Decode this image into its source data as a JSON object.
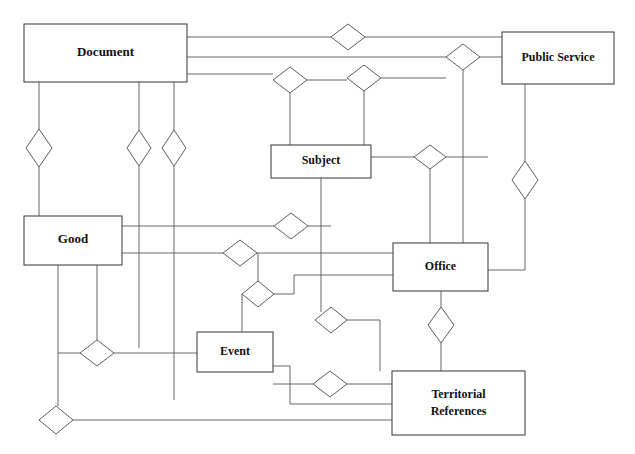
{
  "diagram": {
    "type": "er-diagram",
    "canvas": {
      "width": 635,
      "height": 454
    },
    "style": {
      "background_color": "#ffffff",
      "line_color": "#555555",
      "entity_border_color": "#3d3d3d",
      "entity_fill_color": "#ffffff",
      "relationship_border_color": "#4a4a4a",
      "relationship_fill_color": "#ffffff",
      "text_color": "#111111"
    },
    "entities": [
      {
        "id": "document",
        "label": "Document",
        "x": 24,
        "y": 24,
        "width": 163,
        "height": 58,
        "font_size": 13
      },
      {
        "id": "public_service",
        "label": "Public Service",
        "x": 502,
        "y": 32,
        "width": 112,
        "height": 52,
        "font_size": 12
      },
      {
        "id": "subject",
        "label": "Subject",
        "x": 271,
        "y": 145,
        "width": 100,
        "height": 33,
        "font_size": 12
      },
      {
        "id": "good",
        "label": "Good",
        "x": 24,
        "y": 216,
        "width": 98,
        "height": 49,
        "font_size": 13
      },
      {
        "id": "office",
        "label": "Office",
        "x": 393,
        "y": 243,
        "width": 95,
        "height": 48,
        "font_size": 12
      },
      {
        "id": "event",
        "label": "Event",
        "x": 197,
        "y": 332,
        "width": 76,
        "height": 40,
        "font_size": 12
      },
      {
        "id": "territorial_references",
        "label_line_1": "Territorial",
        "label_line_2": "References",
        "x": 392,
        "y": 371,
        "width": 133,
        "height": 64,
        "font_size": 12
      }
    ],
    "relationships": [
      {
        "id": "r1",
        "cx": 348,
        "cy": 37,
        "rx": 17,
        "ry": 13,
        "connects": [
          "document",
          "public_service"
        ]
      },
      {
        "id": "r2",
        "cx": 463,
        "cy": 57,
        "rx": 17,
        "ry": 13,
        "connects": [
          "document",
          "public_service"
        ]
      },
      {
        "id": "r3",
        "cx": 290,
        "cy": 80,
        "rx": 17,
        "ry": 13,
        "connects": [
          "document",
          "subject"
        ]
      },
      {
        "id": "r4",
        "cx": 364,
        "cy": 78,
        "rx": 17,
        "ry": 13,
        "connects": [
          "document",
          "subject"
        ]
      },
      {
        "id": "r5",
        "cx": 39,
        "cy": 148,
        "rx": 13,
        "ry": 19,
        "connects": [
          "document",
          "good"
        ]
      },
      {
        "id": "r6",
        "cx": 139,
        "cy": 148,
        "rx": 12,
        "ry": 18,
        "connects": [
          "document",
          "event"
        ]
      },
      {
        "id": "r7",
        "cx": 174,
        "cy": 148,
        "rx": 12,
        "ry": 18,
        "connects": [
          "document",
          "territorial_references"
        ]
      },
      {
        "id": "r8",
        "cx": 430,
        "cy": 157,
        "rx": 16,
        "ry": 12,
        "connects": [
          "subject",
          "office"
        ]
      },
      {
        "id": "r9",
        "cx": 525,
        "cy": 180,
        "rx": 13,
        "ry": 19,
        "connects": [
          "public_service",
          "office"
        ]
      },
      {
        "id": "r10",
        "cx": 291,
        "cy": 226,
        "rx": 17,
        "ry": 13,
        "connects": [
          "good",
          "subject"
        ]
      },
      {
        "id": "r11",
        "cx": 240,
        "cy": 253,
        "rx": 17,
        "ry": 13,
        "connects": [
          "good",
          "office"
        ]
      },
      {
        "id": "r12",
        "cx": 258,
        "cy": 294,
        "rx": 16,
        "ry": 13,
        "connects": [
          "event",
          "office"
        ]
      },
      {
        "id": "r13",
        "cx": 331,
        "cy": 320,
        "rx": 16,
        "ry": 13,
        "connects": [
          "subject",
          "territorial_references"
        ]
      },
      {
        "id": "r14",
        "cx": 441,
        "cy": 325,
        "rx": 13,
        "ry": 18,
        "connects": [
          "office",
          "territorial_references"
        ]
      },
      {
        "id": "r15",
        "cx": 97,
        "cy": 353,
        "rx": 17,
        "ry": 13,
        "connects": [
          "good",
          "event"
        ]
      },
      {
        "id": "r16",
        "cx": 330,
        "cy": 384,
        "rx": 17,
        "ry": 13,
        "connects": [
          "event",
          "territorial_references"
        ]
      },
      {
        "id": "r17",
        "cx": 56,
        "cy": 420,
        "rx": 17,
        "ry": 14,
        "connects": [
          "good",
          "territorial_references"
        ]
      }
    ],
    "connector_paths": [
      "M 187 37 L 331 37",
      "M 365 37 L 502 37",
      "M 187 57 L 446 57",
      "M 480 57 L 502 57",
      "M 187 74 L 273 74",
      "M 290 67 L 290 80",
      "M 290 93 L 290 145",
      "M 307 80 L 347 80",
      "M 364 65 L 364 78",
      "M 364 91 L 364 145",
      "M 381 78 L 446 78",
      "M 463 70 L 463 78",
      "M 463 78 L 463 291",
      "M 39 82 L 39 129",
      "M 39 167 L 39 216",
      "M 139 82 L 139 130",
      "M 139 166 L 139 348",
      "M 174 82 L 174 130",
      "M 174 166 L 174 400",
      "M 371 157 L 414 157",
      "M 446 157 L 488 157",
      "M 430 169 L 430 243",
      "M 525 84 L 525 161",
      "M 525 199 L 525 270",
      "M 525 270 L 488 270",
      "M 321 178 L 321 312",
      "M 122 226 L 274 226",
      "M 308 226 L 331 226",
      "M 122 253 L 223 253",
      "M 257 253 L 393 253",
      "M 58 265 L 58 406",
      "M 97 265 L 97 340",
      "M 274 294 L 294 294",
      "M 242 294 L 242 332",
      "M 258 281 L 258 253",
      "M 294 294 L 294 275",
      "M 294 275 L 393 275",
      "M 331 307 L 331 320",
      "M 347 320 L 380 320",
      "M 380 320 L 380 371",
      "M 441 291 L 441 307",
      "M 441 343 L 441 371",
      "M 114 353 L 197 353",
      "M 80 353 L 58 353",
      "M 273 384 L 313 384",
      "M 347 384 L 392 384",
      "M 273 366 L 290 366",
      "M 290 366 L 290 404",
      "M 290 404 L 392 404",
      "M 73 420 L 392 420",
      "M 56 406 L 56 420"
    ]
  }
}
